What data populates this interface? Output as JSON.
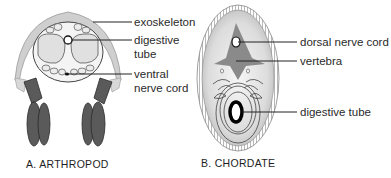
{
  "diagram": {
    "panels": [
      {
        "id": "A",
        "caption": "A.  ARTHROPOD",
        "labels": {
          "exoskeleton": "exoskeleton",
          "digestive_1": "digestive",
          "digestive_2": "tube",
          "ventral_1": "ventral",
          "ventral_2": "nerve cord"
        }
      },
      {
        "id": "B",
        "caption": "B.  CHORDATE",
        "labels": {
          "dorsal": "dorsal nerve cord",
          "vertebra": "vertebra",
          "digestive": "digestive tube"
        }
      }
    ],
    "colors": {
      "line": "#222222",
      "shell": "#c9c9c9",
      "leg": "#555555",
      "vertebra": "#8a8a8a",
      "body_fill": "#e6e6e6"
    }
  }
}
